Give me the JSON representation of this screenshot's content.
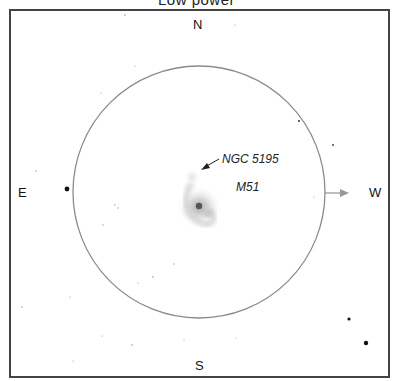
{
  "title": "Low power",
  "directions": {
    "north": "N",
    "south": "S",
    "east": "E",
    "west": "W"
  },
  "labels": {
    "companion": "NGC 5195",
    "galaxy": "M51"
  },
  "field": {
    "circle_color": "#8a8a8a",
    "arrow_color": "#999999",
    "frame_color": "#444444"
  }
}
